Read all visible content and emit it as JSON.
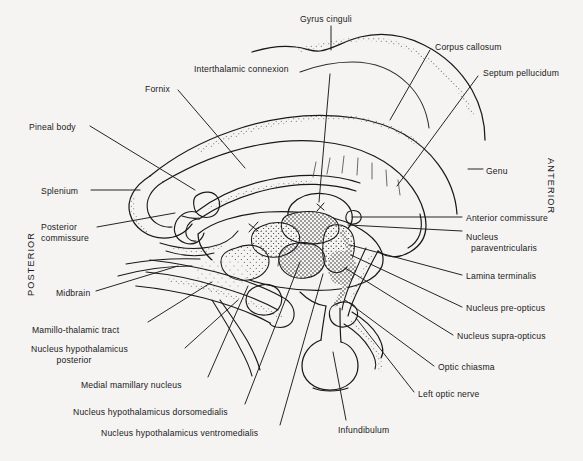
{
  "figure": {
    "kind": "anatomical-diagram",
    "background_color": "#f5f4f2",
    "ink_color": "#19191b",
    "orientation": {
      "left_label": "POSTERIOR",
      "right_label": "ANTERIOR"
    }
  },
  "labels": [
    {
      "id": "gyrus-cinguli",
      "text": "Gyrus cinguli",
      "x": 300,
      "y": 14,
      "align": "left"
    },
    {
      "id": "corpus-callosum",
      "text": "Corpus callosum",
      "x": 435,
      "y": 42,
      "align": "left"
    },
    {
      "id": "septum-pellucidum",
      "text": "Septum pellucidum",
      "x": 483,
      "y": 68,
      "align": "left"
    },
    {
      "id": "interthalamic",
      "text": "Interthalamic connexion",
      "x": 194,
      "y": 64,
      "align": "left"
    },
    {
      "id": "fornix",
      "text": "Fornix",
      "x": 145,
      "y": 84,
      "align": "left"
    },
    {
      "id": "pineal-body",
      "text": "Pineal body",
      "x": 29,
      "y": 122,
      "align": "left"
    },
    {
      "id": "genu",
      "text": "Genu",
      "x": 486,
      "y": 166,
      "align": "left"
    },
    {
      "id": "splenium",
      "text": "Splenium",
      "x": 41,
      "y": 186,
      "align": "left"
    },
    {
      "id": "anterior-commissure",
      "text": "Anterior commissure",
      "x": 466,
      "y": 213,
      "align": "left"
    },
    {
      "id": "posterior-commissure",
      "text": "Posterior\ncommissure",
      "x": 41,
      "y": 222,
      "align": "left"
    },
    {
      "id": "nucleus-paraventricularis",
      "text": "Nucleus\n  paraventricularis",
      "x": 466,
      "y": 232,
      "align": "left"
    },
    {
      "id": "lamina-terminalis",
      "text": "Lamina terminalis",
      "x": 466,
      "y": 271,
      "align": "left"
    },
    {
      "id": "midbrain",
      "text": "Midbrain",
      "x": 56,
      "y": 288,
      "align": "left"
    },
    {
      "id": "nucleus-pre-opticus",
      "text": "Nucleus pre-opticus",
      "x": 466,
      "y": 303,
      "align": "left"
    },
    {
      "id": "nucleus-supra-opticus",
      "text": "Nucleus supra-opticus",
      "x": 457,
      "y": 331,
      "align": "left"
    },
    {
      "id": "mamillo-thalamic",
      "text": "Mamillo-thalamic tract",
      "x": 32,
      "y": 325,
      "align": "left"
    },
    {
      "id": "nucleus-hypo-post",
      "text": "Nucleus hypothalamicus\n          posterior",
      "x": 31,
      "y": 344,
      "align": "left"
    },
    {
      "id": "optic-chiasma",
      "text": "Optic chiasma",
      "x": 438,
      "y": 362,
      "align": "left"
    },
    {
      "id": "medial-mamillary",
      "text": "Medial mamillary nucleus",
      "x": 81,
      "y": 380,
      "align": "left"
    },
    {
      "id": "left-optic-nerve",
      "text": "Left optic nerve",
      "x": 418,
      "y": 389,
      "align": "left"
    },
    {
      "id": "nucleus-hypo-dorso",
      "text": "Nucleus hypothalamicus dorsomedialis",
      "x": 73,
      "y": 407,
      "align": "left"
    },
    {
      "id": "nucleus-hypo-ventro",
      "text": "Nucleus hypothalamicus ventromedialis",
      "x": 101,
      "y": 428,
      "align": "left"
    },
    {
      "id": "infundibulum",
      "text": "Infundibulum",
      "x": 338,
      "y": 425,
      "align": "left"
    }
  ],
  "leaders": [
    {
      "id": "gyrus-cinguli",
      "path": "M 331,26 L 331,50"
    },
    {
      "id": "corpus-callosum",
      "path": "M 430,50 L 390,120"
    },
    {
      "id": "septum-pellucidum",
      "path": "M 478,76 L 397,186"
    },
    {
      "id": "interthalamic",
      "path": "M 330,74 L 319,202"
    },
    {
      "id": "fornix",
      "path": "M 178,90 L 245,168"
    },
    {
      "id": "pineal-body",
      "path": "M 90,126 L 195,190"
    },
    {
      "id": "genu",
      "path": "M 483,169 L 468,169"
    },
    {
      "id": "splenium",
      "path": "M 91,190 L 140,190"
    },
    {
      "id": "anterior-commissure",
      "path": "M 462,217 L 352,217"
    },
    {
      "id": "posterior-commissure",
      "path": "M 97,227 L 175,213"
    },
    {
      "id": "nucleus-paraventricularis",
      "path": "M 462,231 L 348,225"
    },
    {
      "id": "lamina-terminalis",
      "path": "M 462,275 L 350,245"
    },
    {
      "id": "midbrain",
      "path": "M 96,291 L 178,266"
    },
    {
      "id": "nucleus-pre-opticus",
      "path": "M 462,307 L 351,255"
    },
    {
      "id": "nucleus-supra-opticus",
      "path": "M 453,335 L 345,268"
    },
    {
      "id": "mamillo-thalamic",
      "path": "M 148,322 L 212,282"
    },
    {
      "id": "nucleus-hypo-post",
      "path": "M 185,348 L 238,300"
    },
    {
      "id": "optic-chiasma",
      "path": "M 434,366 L 345,300"
    },
    {
      "id": "medial-mamillary",
      "path": "M 208,377 L 248,286"
    },
    {
      "id": "left-optic-nerve",
      "path": "M 414,392 L 356,318"
    },
    {
      "id": "nucleus-hypo-dorso",
      "path": "M 245,404 L 300,262"
    },
    {
      "id": "nucleus-hypo-ventro",
      "path": "M 280,425 L 323,274"
    },
    {
      "id": "infundibulum",
      "path": "M 346,420 L 333,352"
    }
  ],
  "structures": {
    "cingulate_gyrus_outer": "Outer cortical surface above corpus callosum",
    "corpus_callosum_body": "Arched band spanning splenium to genu",
    "thalamus": "Large oval mass below corpus callosum",
    "interthalamic_adhesion": "Irregular blob in third ventricle",
    "fornix_body": "Thin arched band beneath corpus callosum",
    "hypothalamic_nuclei": "Stippled nuclei cluster below thalamus",
    "optic_chiasm": "Small structure anterior-inferior",
    "infundibulum_pituitary": "Bulb-shaped stalk and gland at base",
    "midbrain_brainstem": "Tapering band extending posteroinferiorly"
  }
}
